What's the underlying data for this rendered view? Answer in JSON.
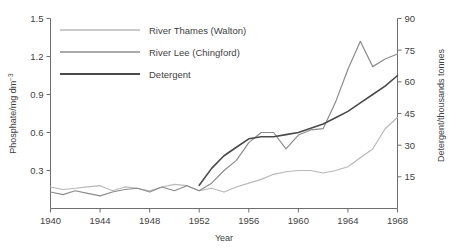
{
  "chart_data": {
    "type": "line",
    "title": "",
    "xlabel": "Year",
    "ylabel": "Phosphate/mg dm⁻³",
    "y2label": "Detergent/thousands tonnes",
    "xlim": [
      1940,
      1968
    ],
    "ylim": [
      0,
      1.5
    ],
    "y2lim": [
      0,
      90
    ],
    "xticks": [
      1940,
      1944,
      1948,
      1952,
      1956,
      1960,
      1964,
      1968
    ],
    "xticklabels": [
      "1940",
      "1944",
      "1948",
      "1952",
      "1956",
      "1960",
      "1964",
      "1968"
    ],
    "yticks": [
      0.3,
      0.6,
      0.9,
      1.2,
      1.5
    ],
    "yticklabels": [
      "0.3",
      "0.6",
      "0.9",
      "1.2",
      "1.5"
    ],
    "y2ticks": [
      15,
      30,
      45,
      60,
      75,
      90
    ],
    "y2ticklabels": [
      "15",
      "30",
      "45",
      "60",
      "75",
      "90"
    ],
    "grid": false,
    "legend_position": "top-left",
    "x": [
      1940,
      1941,
      1942,
      1943,
      1944,
      1945,
      1946,
      1947,
      1948,
      1949,
      1950,
      1951,
      1952,
      1953,
      1954,
      1955,
      1956,
      1957,
      1958,
      1959,
      1960,
      1961,
      1962,
      1963,
      1964,
      1965,
      1966,
      1967,
      1968
    ],
    "series": [
      {
        "name": "River Thames (Walton)",
        "axis": "left",
        "color": "#b9b9b9",
        "values": [
          0.17,
          0.15,
          0.16,
          0.17,
          0.18,
          0.14,
          0.17,
          0.16,
          0.14,
          0.17,
          0.19,
          0.18,
          0.14,
          0.16,
          0.13,
          0.17,
          0.2,
          0.23,
          0.27,
          0.29,
          0.3,
          0.3,
          0.28,
          0.3,
          0.33,
          0.4,
          0.47,
          0.63,
          0.72
        ]
      },
      {
        "name": "River Lee (Chingford)",
        "axis": "left",
        "color": "#8c8c8c",
        "values": [
          0.13,
          0.11,
          0.14,
          0.12,
          0.1,
          0.13,
          0.15,
          0.16,
          0.13,
          0.17,
          0.14,
          0.18,
          0.14,
          0.2,
          0.3,
          0.38,
          0.52,
          0.6,
          0.6,
          0.47,
          0.58,
          0.62,
          0.63,
          0.84,
          1.1,
          1.32,
          1.12,
          1.18,
          1.22
        ]
      },
      {
        "name": "Detergent",
        "axis": "right",
        "color": "#4a4a4a",
        "values": [
          0,
          0,
          0,
          0,
          0,
          0,
          0,
          0,
          0,
          0,
          0,
          0,
          11,
          19,
          25,
          29,
          33,
          34,
          34,
          35,
          36,
          38,
          40,
          43,
          46,
          50,
          54,
          58,
          63
        ]
      }
    ]
  },
  "legend": {
    "items": [
      {
        "label": "River Thames (Walton)",
        "color": "#b9b9b9"
      },
      {
        "label": "River Lee (Chingford)",
        "color": "#8c8c8c"
      },
      {
        "label": "Detergent",
        "color": "#4a4a4a"
      }
    ]
  },
  "axes": {
    "x_title": "Year",
    "y_left_main": "Phosphate/mg dm",
    "y_left_sup": "−3",
    "y_right_title": "Detergent/thousands tonnes"
  }
}
